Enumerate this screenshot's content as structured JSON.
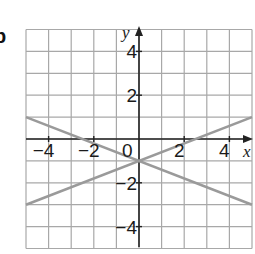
{
  "figure": {
    "part_label": "b",
    "x_axis_label": "x",
    "y_axis_label": "y",
    "origin_label": "0",
    "x_tick_labels": [
      {
        "value": -4,
        "text": "−4"
      },
      {
        "value": -2,
        "text": "−2"
      },
      {
        "value": 2,
        "text": "2"
      },
      {
        "value": 4,
        "text": "4"
      }
    ],
    "y_tick_labels": [
      {
        "value": 4,
        "text": "4"
      },
      {
        "value": 2,
        "text": "2"
      },
      {
        "value": -2,
        "text": "−2"
      },
      {
        "value": -4,
        "text": "−4"
      }
    ],
    "grid": {
      "xmin": -5,
      "xmax": 5,
      "ymin": -5,
      "ymax": 5,
      "step": 1
    },
    "colors": {
      "grid": "#a8a8a8",
      "axes": "#222222",
      "lines": "#9a9a9a"
    }
  },
  "chart_data": {
    "type": "line",
    "title": "",
    "xlabel": "x",
    "ylabel": "y",
    "xlim": [
      -5,
      5
    ],
    "ylim": [
      -5,
      5
    ],
    "grid": true,
    "series": [
      {
        "name": "line A (y = -0.4x - 1)",
        "x": [
          -5,
          5
        ],
        "y": [
          1,
          -3
        ]
      },
      {
        "name": "line B (y = 0.4x - 1)",
        "x": [
          -5,
          5
        ],
        "y": [
          -3,
          1
        ]
      }
    ],
    "annotations": [
      {
        "text": "intersection",
        "x": 0,
        "y": -1
      }
    ]
  }
}
